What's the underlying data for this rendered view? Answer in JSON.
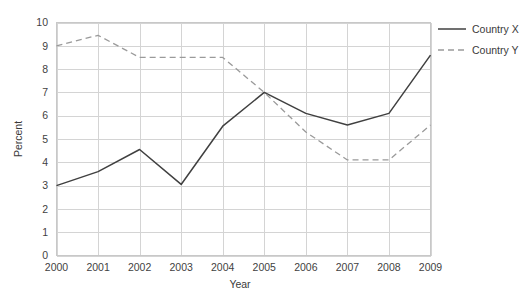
{
  "chart_data": {
    "type": "line",
    "title": "",
    "xlabel": "Year",
    "ylabel": "Percent",
    "categories": [
      "2000",
      "2001",
      "2002",
      "2003",
      "2004",
      "2005",
      "2006",
      "2007",
      "2008",
      "2009"
    ],
    "x": [
      2000,
      2001,
      2002,
      2003,
      2004,
      2005,
      2006,
      2007,
      2008,
      2009
    ],
    "series": [
      {
        "name": "Country X",
        "style": "solid",
        "color": "#404040",
        "values": [
          3.0,
          3.6,
          4.55,
          3.05,
          5.55,
          7.0,
          6.1,
          5.6,
          6.1,
          8.6
        ]
      },
      {
        "name": "Country Y",
        "style": "dashed",
        "color": "#9a9a9a",
        "values": [
          9.0,
          9.45,
          8.5,
          8.5,
          8.5,
          7.0,
          5.3,
          4.1,
          4.1,
          5.6
        ]
      }
    ],
    "ylim": [
      0,
      10
    ],
    "yticks": [
      "0",
      "1",
      "2",
      "3",
      "4",
      "5",
      "6",
      "7",
      "8",
      "9",
      "10"
    ],
    "xlim": [
      2000,
      2009
    ],
    "grid": true,
    "grid_color": "#d4d4d4",
    "legend_position": "right",
    "background": "#ffffff"
  },
  "axes": {
    "y_title": "Percent",
    "x_title": "Year"
  },
  "legend": {
    "entries": [
      {
        "label": "Country X"
      },
      {
        "label": "Country Y"
      }
    ]
  }
}
